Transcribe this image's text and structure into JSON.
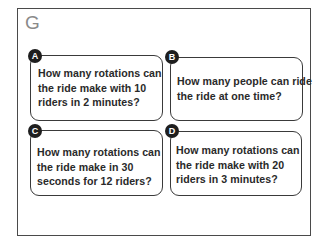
{
  "section": {
    "letter": "G"
  },
  "questions": [
    {
      "label": "A",
      "text_lines": [
        "How many rotations can",
        "the ride make with 10",
        "riders in 2 minutes?"
      ]
    },
    {
      "label": "B",
      "text_lines": [
        "How many people can ride",
        "the ride at one time?"
      ]
    },
    {
      "label": "C",
      "text_lines": [
        "How many rotations can",
        "the ride make in 30",
        "seconds for 12 riders?"
      ]
    },
    {
      "label": "D",
      "text_lines": [
        "How many rotations can",
        "the ride make with 20",
        "riders in 3 minutes?"
      ]
    }
  ]
}
